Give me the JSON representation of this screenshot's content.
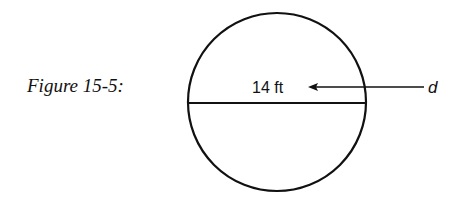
{
  "figure": {
    "caption": "Figure 15-5:",
    "shape": "circle",
    "diameter_label": "14 ft",
    "pointer_label": "d",
    "stroke_color": "#111111",
    "background": "#ffffff"
  }
}
